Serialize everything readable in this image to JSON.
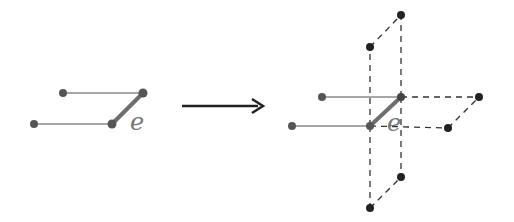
{
  "diagram": {
    "left_graph": {
      "edge_label": "e",
      "nodes": [
        [
          63,
          93
        ],
        [
          143,
          93
        ],
        [
          34,
          124
        ],
        [
          112,
          124
        ]
      ],
      "edges": [
        [
          0,
          1
        ],
        [
          2,
          3
        ]
      ],
      "highlight_edge": [
        3,
        1
      ]
    },
    "arrow": {
      "from": [
        182,
        106
      ],
      "to": [
        263,
        106
      ]
    },
    "right_graph": {
      "edge_label": "e",
      "nodes": [
        [
          322,
          97
        ],
        [
          401,
          97
        ],
        [
          292,
          126
        ],
        [
          370,
          126
        ],
        [
          401,
          15
        ],
        [
          370,
          47
        ],
        [
          479,
          97
        ],
        [
          448,
          128
        ],
        [
          401,
          177
        ],
        [
          370,
          208
        ]
      ],
      "solid_edges": [
        [
          0,
          1
        ],
        [
          2,
          3
        ]
      ],
      "highlight_edge": [
        3,
        1
      ],
      "dashed_edges": [
        [
          1,
          4
        ],
        [
          3,
          5
        ],
        [
          4,
          5
        ],
        [
          1,
          6
        ],
        [
          3,
          7
        ],
        [
          6,
          7
        ],
        [
          1,
          8
        ],
        [
          3,
          9
        ],
        [
          8,
          9
        ]
      ]
    },
    "colors": {
      "solid": "#7a7a7a",
      "node": "#555555",
      "dark_node": "#222222",
      "highlight": "#6e6e6e",
      "dash": "#333333"
    }
  }
}
